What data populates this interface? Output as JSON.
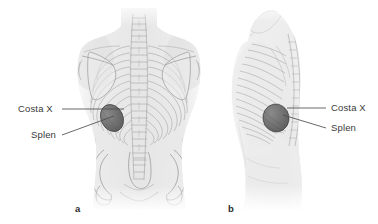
{
  "figure": {
    "background_color": "#ffffff",
    "width": 378,
    "height": 224
  },
  "panels": [
    {
      "id": "a",
      "letter": "a",
      "view": "posterior view of the trunk",
      "letter_x": 75,
      "letter_y": 207,
      "labels": [
        {
          "id": "costa-x",
          "text": "Costa X",
          "x": 18,
          "y": 105,
          "side": "left",
          "leader_from_x": 62,
          "leader_from_y": 109,
          "leader_to_x": 124,
          "leader_to_y": 109
        },
        {
          "id": "splen",
          "text": "Splen",
          "x": 31,
          "y": 131,
          "side": "left",
          "leader_from_x": 62,
          "leader_from_y": 135,
          "leader_to_x": 114,
          "leader_to_y": 116
        }
      ],
      "spleen_marker": {
        "name": "spleen-projection",
        "color": "#6e6e6e",
        "outline_color": "#4a4a4a",
        "center_x": 112,
        "center_y": 118,
        "radius_x": 11,
        "radius_y": 14,
        "rotation_deg": -25
      }
    },
    {
      "id": "b",
      "letter": "b",
      "view": "lateral view of the trunk",
      "letter_x": 228,
      "letter_y": 207,
      "labels": [
        {
          "id": "costa-x",
          "text": "Costa X",
          "x": 331,
          "y": 104,
          "side": "right",
          "leader_from_x": 326,
          "leader_from_y": 108,
          "leader_to_x": 287,
          "leader_to_y": 108
        },
        {
          "id": "splen",
          "text": "Splen",
          "x": 331,
          "y": 124,
          "side": "right",
          "leader_from_x": 326,
          "leader_from_y": 128,
          "leader_to_x": 283,
          "leader_to_y": 115
        }
      ],
      "spleen_marker": {
        "name": "spleen-projection",
        "color": "#6e6e6e",
        "outline_color": "#4a4a4a",
        "center_x": 276,
        "center_y": 118,
        "radius_x": 13,
        "radius_y": 14,
        "rotation_deg": -10
      }
    }
  ],
  "colors": {
    "label_text": "#3a3a3a",
    "panel_letter": "#2b2b2b",
    "leader_line": "#4e4e4e",
    "body_fill_light": "#f0f0f0",
    "body_fill_mid": "#e2e2e2",
    "bone_line": "#9a9a9a",
    "spleen": "#6e6e6e"
  }
}
